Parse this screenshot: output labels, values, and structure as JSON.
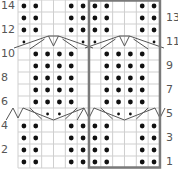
{
  "chart": {
    "type": "knitting-chart",
    "columns": 12,
    "rows": 14,
    "repeat_box": {
      "start_col": 7,
      "end_col": 12,
      "color": "#7a7a7a"
    },
    "grid_color": "#cfcfcf",
    "dot_color": "#111111",
    "row_labels_left": [
      "14",
      "12",
      "10",
      "8",
      "6",
      "4",
      "2"
    ],
    "row_labels_right": [
      "13",
      "11",
      "9",
      "7",
      "5",
      "3",
      "1"
    ],
    "repeat_pattern_rows": {
      "14": {
        "dots": [
          1,
          2,
          5,
          6
        ]
      },
      "13": {
        "dots": [
          1,
          2,
          5,
          6
        ]
      },
      "12": {
        "dots": [
          1,
          2,
          5,
          6
        ]
      },
      "11": {
        "small_dots": [
          1,
          6
        ],
        "cable": "cross-up"
      },
      "10": {
        "dots": [
          2,
          3,
          4,
          5
        ]
      },
      "9": {
        "dots": [
          2,
          3,
          4,
          5
        ]
      },
      "8": {
        "dots": [
          2,
          3,
          4,
          5
        ]
      },
      "7": {
        "dots": [
          2,
          3,
          4,
          5
        ]
      },
      "6": {
        "dots": [
          2,
          3,
          4,
          5
        ]
      },
      "5": {
        "small_dots": [
          3,
          4
        ],
        "cable": "cross-down"
      },
      "4": {
        "dots": [
          1,
          2,
          5,
          6
        ]
      },
      "3": {
        "dots": [
          1,
          2,
          5,
          6
        ]
      },
      "2": {
        "dots": [
          1,
          2,
          5,
          6
        ]
      },
      "1": {
        "dots": [
          1,
          2,
          5,
          6
        ]
      }
    }
  }
}
